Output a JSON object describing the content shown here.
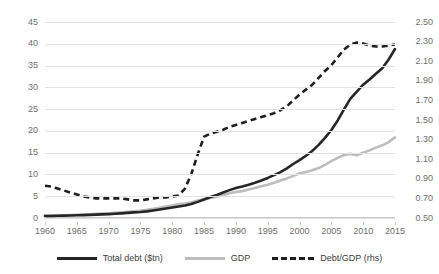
{
  "chart_data": {
    "type": "line",
    "title": "",
    "xlabel": "",
    "ylabel": "",
    "grid": true,
    "legend_position": "bottom",
    "x": [
      1960,
      1961,
      1962,
      1963,
      1964,
      1965,
      1966,
      1967,
      1968,
      1969,
      1970,
      1971,
      1972,
      1973,
      1974,
      1975,
      1976,
      1977,
      1978,
      1979,
      1980,
      1981,
      1982,
      1983,
      1984,
      1985,
      1986,
      1987,
      1988,
      1989,
      1990,
      1991,
      1992,
      1993,
      1994,
      1995,
      1996,
      1997,
      1998,
      1999,
      2000,
      2001,
      2002,
      2003,
      2004,
      2005,
      2006,
      2007,
      2008,
      2009,
      2010,
      2011,
      2012,
      2013,
      2014,
      2015
    ],
    "xticks": [
      1960,
      1965,
      1970,
      1975,
      1980,
      1985,
      1990,
      1995,
      2000,
      2005,
      2010,
      2015
    ],
    "yticks_left": [
      0,
      5,
      10,
      15,
      20,
      25,
      30,
      35,
      40,
      45
    ],
    "yticks_right": [
      0.5,
      0.7,
      0.9,
      1.1,
      1.3,
      1.5,
      1.7,
      1.9,
      2.1,
      2.3,
      2.5
    ],
    "ylim_left": [
      0,
      45
    ],
    "ylim_right": [
      0.5,
      2.5
    ],
    "series": [
      {
        "name": "Total debt ($tn)",
        "axis": "left",
        "style": "solid",
        "color": "#262626",
        "width": 2.6,
        "values": [
          0.45,
          0.47,
          0.5,
          0.54,
          0.58,
          0.62,
          0.66,
          0.71,
          0.77,
          0.83,
          0.89,
          0.97,
          1.06,
          1.17,
          1.28,
          1.38,
          1.53,
          1.72,
          1.94,
          2.18,
          2.4,
          2.65,
          2.88,
          3.22,
          3.7,
          4.25,
          4.8,
          5.3,
          5.85,
          6.4,
          6.9,
          7.25,
          7.65,
          8.1,
          8.6,
          9.2,
          9.85,
          10.55,
          11.4,
          12.4,
          13.3,
          14.3,
          15.4,
          16.8,
          18.4,
          20.2,
          22.4,
          25.0,
          27.4,
          29.0,
          30.6,
          31.8,
          33.1,
          34.4,
          36.4,
          38.8
        ]
      },
      {
        "name": "GDP",
        "axis": "left",
        "style": "solid",
        "color": "#bdbdbd",
        "width": 2.6,
        "values": [
          0.54,
          0.56,
          0.6,
          0.64,
          0.69,
          0.74,
          0.81,
          0.86,
          0.94,
          1.02,
          1.07,
          1.17,
          1.28,
          1.43,
          1.55,
          1.69,
          1.88,
          2.09,
          2.36,
          2.63,
          2.86,
          3.21,
          3.34,
          3.63,
          4.04,
          4.34,
          4.58,
          4.87,
          5.25,
          5.66,
          5.98,
          6.17,
          6.54,
          6.88,
          7.31,
          7.66,
          8.1,
          8.61,
          9.09,
          9.66,
          10.25,
          10.58,
          10.94,
          11.46,
          12.22,
          13.04,
          13.82,
          14.45,
          14.72,
          14.42,
          14.96,
          15.52,
          16.16,
          16.69,
          17.43,
          18.5
        ]
      },
      {
        "name": "Debt/GDP (rhs)",
        "axis": "right",
        "style": "dashed",
        "color": "#1f1f1f",
        "width": 2.6,
        "values": [
          0.83,
          0.82,
          0.8,
          0.78,
          0.76,
          0.74,
          0.72,
          0.71,
          0.7,
          0.7,
          0.7,
          0.7,
          0.7,
          0.69,
          0.68,
          0.68,
          0.69,
          0.7,
          0.71,
          0.71,
          0.72,
          0.73,
          0.8,
          0.95,
          1.15,
          1.33,
          1.36,
          1.38,
          1.4,
          1.43,
          1.45,
          1.47,
          1.49,
          1.51,
          1.53,
          1.55,
          1.57,
          1.6,
          1.64,
          1.7,
          1.76,
          1.81,
          1.86,
          1.93,
          2.0,
          2.06,
          2.14,
          2.22,
          2.27,
          2.29,
          2.28,
          2.26,
          2.25,
          2.25,
          2.26,
          2.27
        ]
      }
    ]
  },
  "axes": {
    "left_labels": [
      "45",
      "40",
      "35",
      "30",
      "25",
      "20",
      "15",
      "10",
      "5",
      "0"
    ],
    "right_labels": [
      "2.50",
      "2.30",
      "2.10",
      "1.90",
      "1.70",
      "1.50",
      "1.30",
      "1.10",
      "0.90",
      "0.70",
      "0.50"
    ],
    "x_labels": [
      "1960",
      "1965",
      "1970",
      "1975",
      "1980",
      "1985",
      "1990",
      "1995",
      "2000",
      "2005",
      "2010",
      "2015"
    ]
  },
  "legend": {
    "items": [
      {
        "label": "Total debt ($tn)",
        "marker": "solid-dark-line-swatch"
      },
      {
        "label": "GDP",
        "marker": "solid-gray-line-swatch"
      },
      {
        "label": "Debt/GDP (rhs)",
        "marker": "dashed-dark-line-swatch"
      }
    ]
  },
  "title": {
    "text": ""
  }
}
